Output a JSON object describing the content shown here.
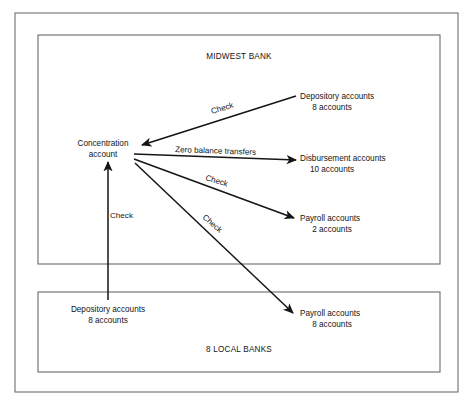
{
  "diagram": {
    "outer_frame": {
      "name": "outer-frame"
    },
    "sections": [
      {
        "id": "midwest-bank",
        "title": "MIDWEST BANK",
        "title_x": 239,
        "title_y": 59,
        "rect": {
          "x": 38,
          "y": 35,
          "w": 402,
          "h": 229
        }
      },
      {
        "id": "local-banks",
        "title": "8 LOCAL BANKS",
        "title_x": 239,
        "title_y": 352,
        "rect": {
          "x": 38,
          "y": 292,
          "w": 402,
          "h": 80
        }
      }
    ],
    "nodes": [
      {
        "id": "concentration-account",
        "name": "node-concentration-account",
        "lines": [
          "Concentration",
          "account"
        ],
        "x": 103,
        "y": 146,
        "anchor": "middle",
        "line_height": 11
      },
      {
        "id": "depository-accounts-midwest",
        "name": "node-depository-accounts-midwest",
        "lines": [
          "Depository accounts",
          "8 accounts"
        ],
        "x": 300,
        "y": 99,
        "anchor": "start",
        "line_height": 11,
        "center_second": true
      },
      {
        "id": "disbursement-accounts",
        "name": "node-disbursement-accounts",
        "lines": [
          "Disbursement accounts",
          "10 accounts"
        ],
        "x": 300,
        "y": 161,
        "anchor": "start",
        "line_height": 11,
        "center_second": true
      },
      {
        "id": "payroll-accounts-midwest",
        "name": "node-payroll-accounts-midwest",
        "lines": [
          "Payroll accounts",
          "2 accounts"
        ],
        "x": 300,
        "y": 221,
        "anchor": "start",
        "line_height": 11,
        "center_second": true
      },
      {
        "id": "depository-accounts-local",
        "name": "node-depository-accounts-local",
        "lines": [
          "Depository accounts",
          "8 accounts"
        ],
        "x": 108,
        "y": 312,
        "anchor": "middle",
        "line_height": 11
      },
      {
        "id": "payroll-accounts-local",
        "name": "node-payroll-accounts-local",
        "lines": [
          "Payroll accounts",
          "8 accounts"
        ],
        "x": 300,
        "y": 316,
        "anchor": "start",
        "line_height": 11,
        "center_second": true
      }
    ],
    "edges": [
      {
        "id": "edge-depository-to-concentration",
        "name": "edge-depository-to-concentration",
        "label": "Check",
        "from": "depository-accounts-midwest",
        "to": "concentration-account",
        "x1": 296,
        "y1": 96,
        "x2": 142,
        "y2": 145,
        "label_x": 212,
        "label_y": 114,
        "label_rotate": -17
      },
      {
        "id": "edge-concentration-to-disbursement",
        "name": "edge-concentration-to-disbursement",
        "label": "Zero balance transfers",
        "from": "concentration-account",
        "to": "disbursement-accounts",
        "x1": 134,
        "y1": 154,
        "x2": 296,
        "y2": 160,
        "label_x": 175,
        "label_y": 152,
        "label_rotate": 2
      },
      {
        "id": "edge-concentration-to-payroll-midwest",
        "name": "edge-concentration-to-payroll-midwest",
        "label": "Check",
        "from": "concentration-account",
        "to": "payroll-accounts-midwest",
        "x1": 134,
        "y1": 159,
        "x2": 294,
        "y2": 218,
        "label_x": 205,
        "label_y": 180,
        "label_rotate": 17
      },
      {
        "id": "edge-concentration-to-payroll-local",
        "name": "edge-concentration-to-payroll-local",
        "label": "Check",
        "from": "concentration-account",
        "to": "payroll-accounts-local",
        "x1": 135,
        "y1": 163,
        "x2": 293,
        "y2": 313,
        "label_x": 202,
        "label_y": 218,
        "label_rotate": 41
      },
      {
        "id": "edge-depository-local-to-concentration",
        "name": "edge-depository-local-to-concentration",
        "label": "Check",
        "from": "depository-accounts-local",
        "to": "concentration-account",
        "x1": 108,
        "y1": 300,
        "x2": 108,
        "y2": 162,
        "label_x": 110,
        "label_y": 218,
        "label_rotate": 0
      }
    ]
  }
}
